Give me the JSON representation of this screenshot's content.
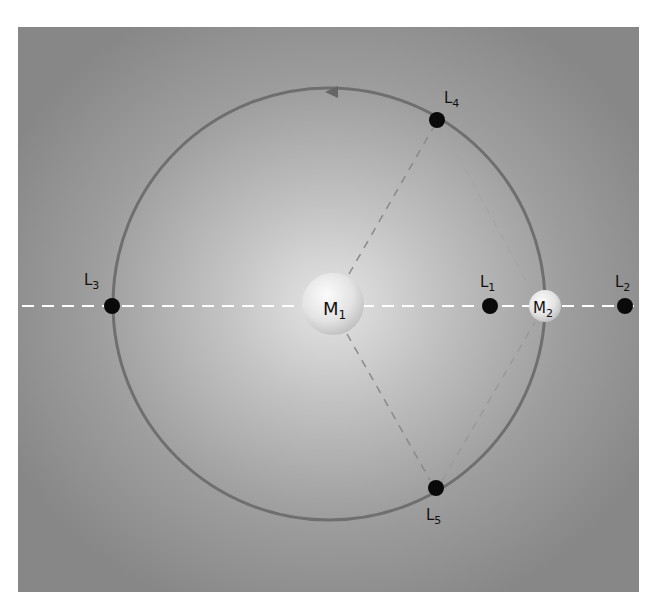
{
  "diagram": {
    "colors": {
      "background_outer": "#878787",
      "background_inner": "#e4e4e4",
      "orbit": "#6f6f6f",
      "axis_dash": "#ffffff",
      "guide_dash": "#8a8a8a",
      "point": "#0a0a0a",
      "body_fill": "#e8e8e8"
    },
    "orbit": {
      "cx": 329,
      "cy": 304,
      "r": 216,
      "direction": "counter-clockwise"
    },
    "bodies": [
      {
        "id": "M1",
        "label_main": "M",
        "label_sub": "1",
        "x": 333,
        "y": 304,
        "r": 31
      },
      {
        "id": "M2",
        "label_main": "M",
        "label_sub": "2",
        "x": 545,
        "y": 306,
        "r": 16
      }
    ],
    "points": [
      {
        "id": "L1",
        "label_main": "L",
        "label_sub": "1",
        "x": 490,
        "y": 306
      },
      {
        "id": "L2",
        "label_main": "L",
        "label_sub": "2",
        "x": 625,
        "y": 306
      },
      {
        "id": "L3",
        "label_main": "L",
        "label_sub": "3",
        "x": 112,
        "y": 306
      },
      {
        "id": "L4",
        "label_main": "L",
        "label_sub": "4",
        "x": 437,
        "y": 120
      },
      {
        "id": "L5",
        "label_main": "L",
        "label_sub": "5",
        "x": 436,
        "y": 488
      }
    ]
  }
}
